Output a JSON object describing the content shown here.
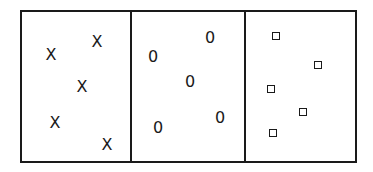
{
  "diagram": {
    "panels": [
      {
        "name": "panel-x",
        "symbol": "X",
        "points": [
          [
            51,
            55
          ],
          [
            97,
            42
          ],
          [
            82,
            87
          ],
          [
            55,
            123
          ],
          [
            107,
            145
          ]
        ]
      },
      {
        "name": "panel-o",
        "symbol": "0",
        "points": [
          [
            153,
            57
          ],
          [
            210,
            38
          ],
          [
            190,
            82
          ],
          [
            158,
            128
          ],
          [
            220,
            118
          ]
        ]
      },
      {
        "name": "panel-square",
        "symbol": "□",
        "points": [
          [
            276,
            36
          ],
          [
            318,
            65
          ],
          [
            271,
            89
          ],
          [
            303,
            112
          ],
          [
            273,
            133
          ]
        ]
      }
    ],
    "colors": {
      "line": "#1a1a1a",
      "background": "#ffffff"
    }
  }
}
